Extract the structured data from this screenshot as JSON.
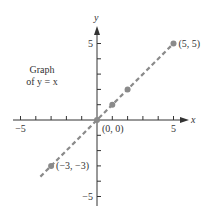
{
  "chart_data": {
    "type": "line",
    "title": "",
    "annotation_lines": [
      "Graph",
      "of y = x"
    ],
    "xlabel": "x",
    "ylabel": "y",
    "xlim": [
      -5,
      5
    ],
    "ylim": [
      -5,
      5
    ],
    "tick_step": 1,
    "x_tick_labels": [
      {
        "value": -5,
        "label": "−5"
      },
      {
        "value": 5,
        "label": "5"
      }
    ],
    "y_tick_labels": [
      {
        "value": 5,
        "label": "5"
      },
      {
        "value": -5,
        "label": "−5"
      }
    ],
    "grid": false,
    "legend": "none",
    "series": [
      {
        "name": "y = x",
        "style": "dashed",
        "line_extent_x": [
          -3.7,
          5
        ],
        "color": "#8a8a8a"
      }
    ],
    "points": [
      {
        "x": 5,
        "y": 5,
        "label": "(5, 5)"
      },
      {
        "x": 2,
        "y": 2,
        "label": ""
      },
      {
        "x": 1,
        "y": 1,
        "label": ""
      },
      {
        "x": 0,
        "y": 0,
        "label": "(0, 0)"
      },
      {
        "x": -3,
        "y": -3,
        "label": "(−3, −3)"
      }
    ],
    "colors": {
      "axis": "#333333",
      "line": "#8a8a8a",
      "point": "#8a8a8a",
      "text": "#333333"
    }
  }
}
